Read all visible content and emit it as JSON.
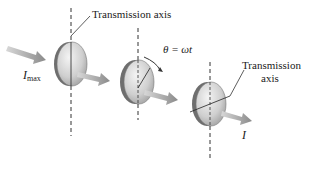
{
  "diagram": {
    "labels": {
      "axis_top": "Transmission axis",
      "angle": "θ = ωt",
      "axis_right_line1": "Transmission",
      "axis_right_line2": "axis",
      "i_max_main": "I",
      "i_max_sub": "max",
      "i_out": "I"
    },
    "colors": {
      "disk_light": "#e6e6e6",
      "disk_dark": "#8a8a8a",
      "disk_edge": "#555555",
      "arrow": "#8f8f8f",
      "axis_line": "#333333"
    }
  }
}
